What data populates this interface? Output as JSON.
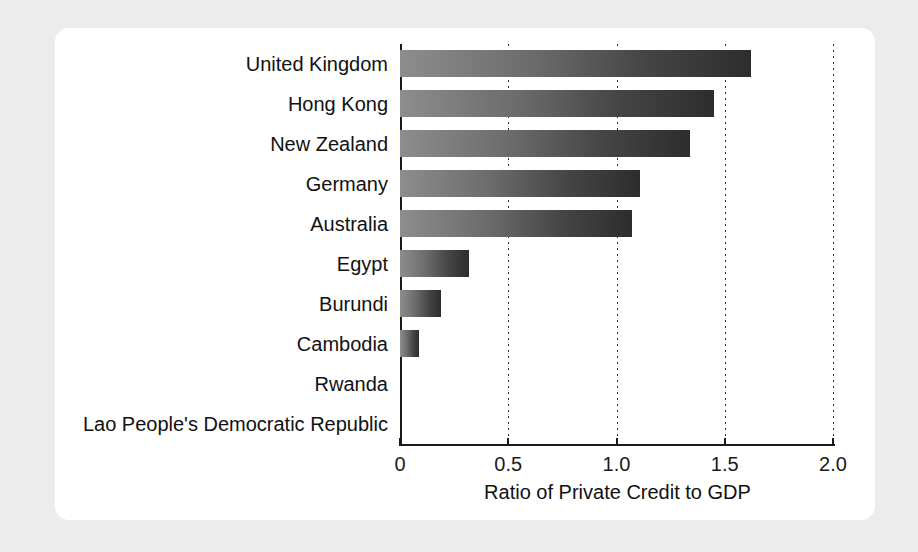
{
  "chart_data": {
    "type": "bar",
    "orientation": "horizontal",
    "title": "",
    "xlabel": "Ratio of Private Credit to GDP",
    "ylabel": "",
    "xlim": [
      0,
      2.0
    ],
    "xticks": [
      "0",
      "0.5",
      "1.0",
      "1.5",
      "2.0"
    ],
    "xtick_values": [
      0,
      0.5,
      1.0,
      1.5,
      2.0
    ],
    "grid": "vertical dotted gridlines at each x tick",
    "legend": "none",
    "categories": [
      "United Kingdom",
      "Hong Kong",
      "New Zealand",
      "Germany",
      "Australia",
      "Egypt",
      "Burundi",
      "Cambodia",
      "Rwanda",
      "Lao People's Democratic Republic"
    ],
    "values": [
      1.62,
      1.45,
      1.34,
      1.11,
      1.07,
      0.32,
      0.19,
      0.09,
      0.0,
      0.0
    ],
    "bars": [
      {
        "label": "United Kingdom",
        "value": 1.62
      },
      {
        "label": "Hong Kong",
        "value": 1.45
      },
      {
        "label": "New Zealand",
        "value": 1.34
      },
      {
        "label": "Germany",
        "value": 1.11
      },
      {
        "label": "Australia",
        "value": 1.07
      },
      {
        "label": "Egypt",
        "value": 0.32
      },
      {
        "label": "Burundi",
        "value": 0.19
      },
      {
        "label": "Cambodia",
        "value": 0.09
      },
      {
        "label": "Rwanda",
        "value": 0.0
      },
      {
        "label": "Lao People's Democratic Republic",
        "value": 0.0
      }
    ],
    "colors": {
      "bar_gradient_start": "#8d8d8d",
      "bar_gradient_end": "#2d2d2d",
      "axis": "#1a1a1a",
      "gridline": "#2b2b2b",
      "text": "#111111",
      "plot_background": "#ffffff",
      "page_background": "#ececec"
    }
  }
}
